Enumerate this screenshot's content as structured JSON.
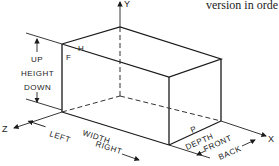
{
  "figure": {
    "caption_fragment": "version in orde",
    "axes": {
      "y": "Y",
      "z": "Z",
      "x": "X"
    },
    "vertex_labels": {
      "front_top_left": "F",
      "top_face": "H",
      "right_face_bottom": "P"
    },
    "dimension_labels": {
      "up": "UP",
      "height": "HEIGHT",
      "down": "DOWN",
      "left": "LEFT",
      "width": "WIDTH",
      "right": "RIGHT",
      "depth": "DEPTH",
      "front": "FRONT",
      "back": "BACK"
    },
    "colors": {
      "line": "#1a1a1a",
      "background": "#ffffff"
    }
  }
}
